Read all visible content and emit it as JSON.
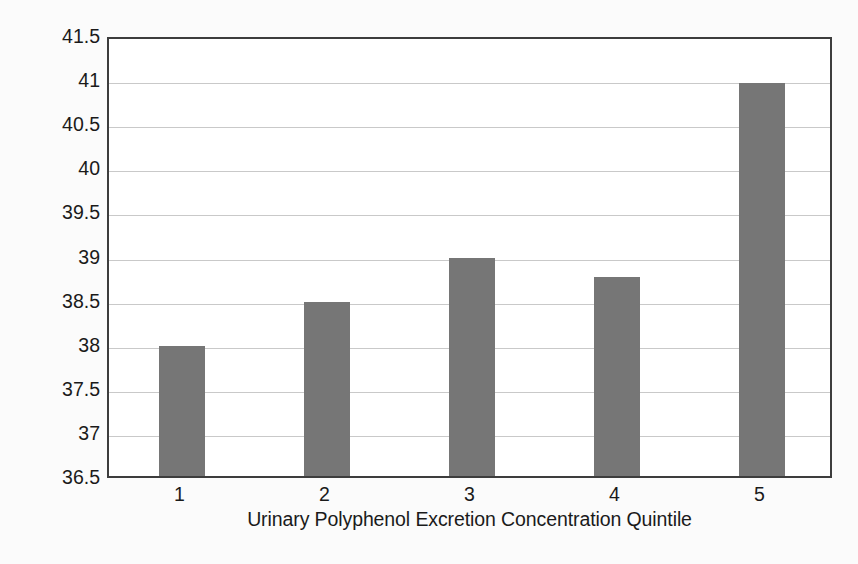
{
  "chart_data": {
    "type": "bar",
    "title": "",
    "subtitle": "",
    "xlabel": "Urinary Polyphenol Excretion Concentration Quintile",
    "ylabel": "Immediate Memory Recall Score",
    "categories": [
      "1",
      "2",
      "3",
      "4",
      "5"
    ],
    "values": [
      38.0,
      38.5,
      39.0,
      38.78,
      40.98
    ],
    "series": [
      {
        "name": "Immediate Memory Recall Score",
        "values": [
          38.0,
          38.5,
          39.0,
          38.78,
          40.98
        ]
      }
    ],
    "ylim": [
      36.5,
      41.5
    ],
    "ytick_labels": [
      "41.5",
      "41",
      "40.5",
      "40",
      "39.5",
      "39",
      "38.5",
      "38",
      "37.5",
      "37",
      "36.5"
    ],
    "ytick_values": [
      41.5,
      41,
      40.5,
      40,
      39.5,
      39,
      38.5,
      38,
      37.5,
      37,
      36.5
    ],
    "ytick_step": 0.5,
    "xtick_labels": [
      "1",
      "2",
      "3",
      "4",
      "5"
    ],
    "grid": "horizontal",
    "legend": "none",
    "annotations": [],
    "colors": {
      "bar": "#767676",
      "frame": "#3d3d3d",
      "gridline": "#c9c9c9",
      "plot_background": "#ffffff",
      "figure_background": "#fbfbfb",
      "text": "#1a1a1a"
    }
  }
}
